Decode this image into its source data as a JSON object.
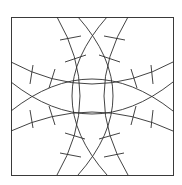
{
  "diagram": {
    "title": "",
    "stroke_color": "#2e2e2e",
    "background": "#ffffff",
    "frame": {
      "x": 11,
      "y": 17,
      "width": 162,
      "height": 158
    },
    "arcs": [
      {
        "name": "left-vertical-outer",
        "d": "M57,17 Q103,96 57,175"
      },
      {
        "name": "left-vertical-inner",
        "d": "M78,17 Q148,96 78,175"
      },
      {
        "name": "right-vertical-outer",
        "d": "M128,17 Q80,96 128,175"
      },
      {
        "name": "right-vertical-inner",
        "d": "M107,17 Q37,96 107,175"
      },
      {
        "name": "upper-horizontal-outer",
        "d": "M11,62 Q92,106 173,62"
      },
      {
        "name": "upper-horizontal-inner",
        "d": "M11,82 Q92,146 173,82"
      },
      {
        "name": "lower-horizontal-outer",
        "d": "M11,131 Q92,93 173,131"
      },
      {
        "name": "lower-horizontal-inner",
        "d": "M11,111 Q92,47 173,111"
      }
    ],
    "dividers": [
      {
        "x1": 60,
        "y1": 40,
        "x2": 81,
        "y2": 36
      },
      {
        "x1": 65,
        "y1": 62,
        "x2": 86,
        "y2": 55
      },
      {
        "x1": 104,
        "y1": 36,
        "x2": 125,
        "y2": 40
      },
      {
        "x1": 99,
        "y1": 55,
        "x2": 120,
        "y2": 62
      },
      {
        "x1": 65,
        "y1": 133,
        "x2": 85,
        "y2": 139
      },
      {
        "x1": 60,
        "y1": 153,
        "x2": 81,
        "y2": 157
      },
      {
        "x1": 99,
        "y1": 139,
        "x2": 120,
        "y2": 133
      },
      {
        "x1": 104,
        "y1": 157,
        "x2": 124,
        "y2": 153
      },
      {
        "x1": 33,
        "y1": 65,
        "x2": 30,
        "y2": 84
      },
      {
        "x1": 55,
        "y1": 69,
        "x2": 49,
        "y2": 88
      },
      {
        "x1": 30,
        "y1": 110,
        "x2": 33,
        "y2": 128
      },
      {
        "x1": 49,
        "y1": 106,
        "x2": 55,
        "y2": 125
      },
      {
        "x1": 151,
        "y1": 65,
        "x2": 153,
        "y2": 84
      },
      {
        "x1": 131,
        "y1": 69,
        "x2": 137,
        "y2": 88
      },
      {
        "x1": 153,
        "y1": 110,
        "x2": 151,
        "y2": 128
      },
      {
        "x1": 136,
        "y1": 106,
        "x2": 131,
        "y2": 125
      }
    ]
  }
}
